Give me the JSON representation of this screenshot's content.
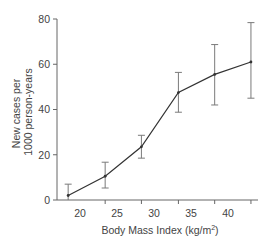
{
  "chart_data": {
    "type": "line",
    "title": "",
    "xlabel": "Body Mass Index (kg/m",
    "xlabel_sup": "2",
    "xlabel_close": ")",
    "ylabel_line1": "New cases per",
    "ylabel_line2": "1000 person-years",
    "ylim": [
      0,
      80
    ],
    "xlim": [
      16.8,
      43.9
    ],
    "yticks": [
      0,
      20,
      40,
      60,
      80
    ],
    "xticks": [
      20,
      25,
      30,
      35,
      40
    ],
    "xtick_marks": [
      23.4,
      28.3,
      33.3,
      38.2,
      43.1
    ],
    "grid": false,
    "legend": null,
    "series": [
      {
        "name": "Incidence",
        "x": [
          18.4,
          23.4,
          28.3,
          33.3,
          38.2,
          43.1
        ],
        "y": [
          2,
          10.5,
          23.5,
          47.5,
          55.5,
          61
        ],
        "err_low": [
          0,
          5.3,
          18.5,
          38.8,
          42,
          45
        ],
        "err_high": [
          7,
          16.7,
          28.6,
          56.4,
          68.7,
          78.4
        ]
      }
    ]
  },
  "colors": {
    "line": "#333333",
    "error_bar": "#7a7a7a",
    "axis": "#666666",
    "text": "#444444"
  }
}
